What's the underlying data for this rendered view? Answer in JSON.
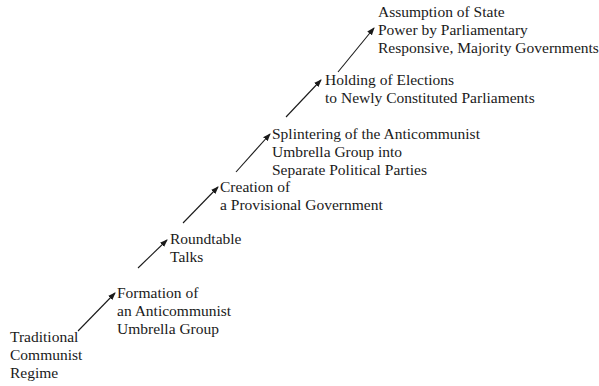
{
  "diagram": {
    "type": "stepwise-process",
    "stages": [
      {
        "id": "stage-0",
        "lines": [
          "Traditional",
          "Communist",
          "Regime"
        ]
      },
      {
        "id": "stage-1",
        "lines": [
          "Formation of",
          "an Anticommunist",
          "Umbrella Group"
        ]
      },
      {
        "id": "stage-2",
        "lines": [
          "Roundtable",
          "Talks"
        ]
      },
      {
        "id": "stage-3",
        "lines": [
          "Creation of",
          "a Provisional Government"
        ]
      },
      {
        "id": "stage-4",
        "lines": [
          "Splintering of the Anticommunist",
          "Umbrella Group into",
          "Separate Political Parties"
        ]
      },
      {
        "id": "stage-5",
        "lines": [
          "Holding of Elections",
          "to Newly Constituted Parliaments"
        ]
      },
      {
        "id": "stage-6",
        "lines": [
          "Assumption of State",
          "Power by Parliamentary",
          "Responsive, Majority Governments"
        ]
      }
    ],
    "arrows": [
      {
        "from": "stage-0",
        "to": "stage-1"
      },
      {
        "from": "stage-1",
        "to": "stage-2"
      },
      {
        "from": "stage-2",
        "to": "stage-3"
      },
      {
        "from": "stage-3",
        "to": "stage-4"
      },
      {
        "from": "stage-4",
        "to": "stage-5"
      },
      {
        "from": "stage-5",
        "to": "stage-6"
      }
    ],
    "colors": {
      "text": "#1a1a1a",
      "arrow": "#1a1a1a",
      "background": "#ffffff"
    }
  }
}
